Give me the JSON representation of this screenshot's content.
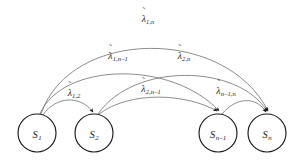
{
  "diagram": {
    "type": "state-transition-graph",
    "background_color": "#ffffff",
    "node_stroke_color": "#1a1a1a",
    "edge_stroke_color": "#6e6e6e",
    "label_color": "#1a1a1a",
    "lambda_symbol": "λ",
    "tilde_symbol": "˜",
    "nodes": [
      {
        "id": "s1",
        "label": "S",
        "subscript": "1",
        "cx": 37,
        "cy": 133,
        "r": 19
      },
      {
        "id": "s2",
        "label": "S",
        "subscript": "2",
        "cx": 94,
        "cy": 133,
        "r": 19
      },
      {
        "id": "sn-1",
        "label": "S",
        "subscript": "n–1",
        "cx": 218,
        "cy": 133,
        "r": 19
      },
      {
        "id": "sn",
        "label": "S",
        "subscript": "n",
        "cx": 267,
        "cy": 133,
        "r": 19
      }
    ],
    "edges": [
      {
        "id": "e-1-n",
        "from": "s1",
        "to": "sn",
        "sub": "1,n",
        "label_x": 148,
        "label_y": 18
      },
      {
        "id": "e-1-nm1",
        "from": "s1",
        "to": "sn-1",
        "sub": "1,n–1",
        "label_x": 118,
        "label_y": 55
      },
      {
        "id": "e-2-n",
        "from": "s2",
        "to": "sn",
        "sub": "2,n",
        "label_x": 184,
        "label_y": 55
      },
      {
        "id": "e-1-2",
        "from": "s1",
        "to": "s2",
        "sub": "1,2",
        "label_x": 74,
        "label_y": 92
      },
      {
        "id": "e-2-nm1",
        "from": "s2",
        "to": "sn-1",
        "sub": "2,n–1",
        "label_x": 151,
        "label_y": 88
      },
      {
        "id": "e-nm1-n",
        "from": "sn-1",
        "to": "sn",
        "sub": "n–1,n",
        "label_x": 226,
        "label_y": 90
      }
    ]
  }
}
